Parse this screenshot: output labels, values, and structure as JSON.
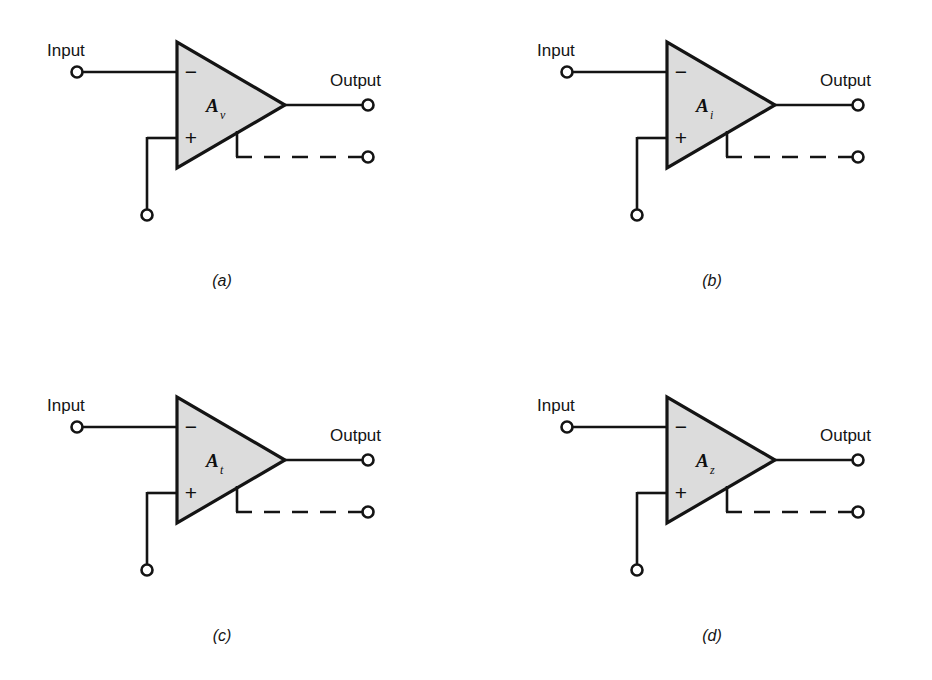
{
  "figure": {
    "type": "circuit-diagram",
    "background_color": "#ffffff",
    "line_color": "#141414",
    "triangle_fill": "#dcdcdc",
    "text_color": "#141414"
  },
  "labels": {
    "input": "Input",
    "output": "Output",
    "inverting_sign": "−",
    "noninverting_sign": "+"
  },
  "panels": [
    {
      "id": "a",
      "caption": "(a)",
      "gain_symbol": "A",
      "gain_subscript": "v",
      "input_label": "Input",
      "output_label": "Output"
    },
    {
      "id": "b",
      "caption": "(b)",
      "gain_symbol": "A",
      "gain_subscript": "i",
      "input_label": "Input",
      "output_label": "Output"
    },
    {
      "id": "c",
      "caption": "(c)",
      "gain_symbol": "A",
      "gain_subscript": "t",
      "input_label": "Input",
      "output_label": "Output"
    },
    {
      "id": "d",
      "caption": "(d)",
      "gain_symbol": "A",
      "gain_subscript": "z",
      "input_label": "Input",
      "output_label": "Output"
    }
  ]
}
